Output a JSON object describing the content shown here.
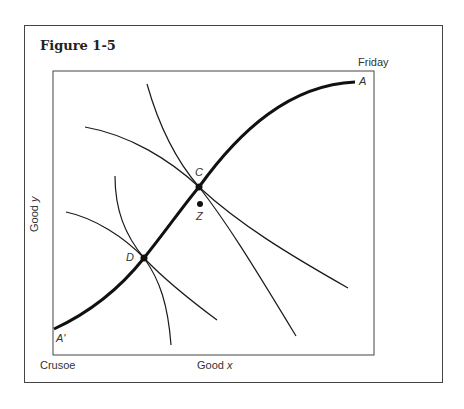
{
  "figure": {
    "title": "Figure 1-5",
    "corner_labels": {
      "top_right": "Friday",
      "bottom_left": "Crusoe"
    },
    "axes": {
      "x_label": "Good x",
      "x_label_plain": "Good ",
      "x_label_var": "x",
      "y_label_plain": "Good ",
      "y_label_var": "y"
    },
    "points": [
      {
        "name": "A",
        "x": 355,
        "y": 82
      },
      {
        "name": "A'",
        "x": 54,
        "y": 329
      },
      {
        "name": "C",
        "x": 199,
        "y": 187
      },
      {
        "name": "D",
        "x": 144,
        "y": 258
      },
      {
        "name": "Z",
        "x": 200,
        "y": 204
      }
    ],
    "curves": [
      {
        "name": "contract-curve",
        "from": "A'",
        "to": "A",
        "through": [
          "D",
          "C"
        ],
        "weight": "bold"
      },
      {
        "name": "crusoe-indifference-high",
        "tangent_at": "C"
      },
      {
        "name": "friday-indifference-high",
        "tangent_at": "C"
      },
      {
        "name": "crusoe-indifference-low",
        "tangent_at": "D"
      },
      {
        "name": "friday-indifference-low",
        "tangent_at": "D"
      }
    ],
    "colors": {
      "line": "#1a1a1a",
      "frame": "#444444",
      "background": "#ffffff"
    }
  }
}
